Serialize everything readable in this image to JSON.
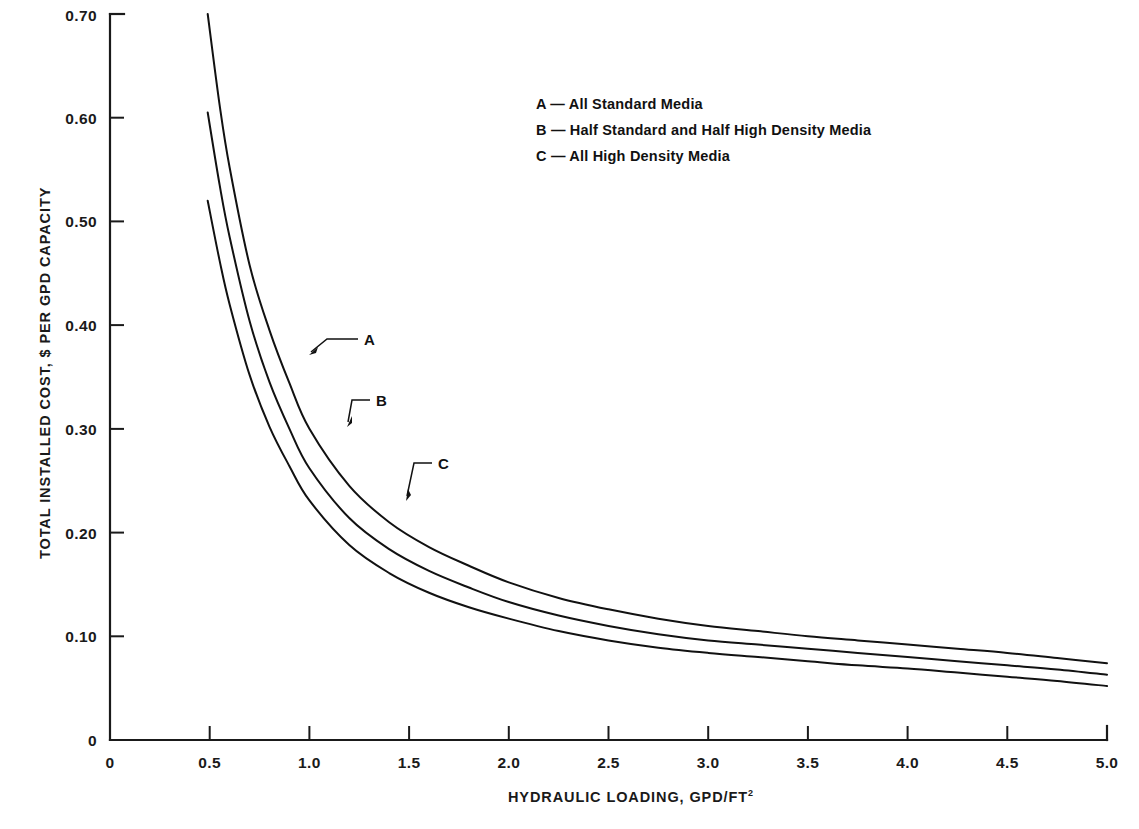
{
  "chart_data": {
    "type": "line",
    "title": "",
    "xlabel": "HYDRAULIC LOADING, GPD/FT",
    "xlabel_superscript": "2",
    "ylabel": "TOTAL INSTALLED COST, $ PER GPD CAPACITY",
    "xlim": [
      0,
      5.0
    ],
    "ylim": [
      0,
      0.7
    ],
    "grid": false,
    "legend_position": "top-center",
    "xticks": [
      "0",
      "0.5",
      "1.0",
      "1.5",
      "2.0",
      "2.5",
      "3.0",
      "3.5",
      "4.0",
      "4.5",
      "5.0"
    ],
    "xtick_values": [
      0,
      0.5,
      1.0,
      1.5,
      2.0,
      2.5,
      3.0,
      3.5,
      4.0,
      4.5,
      5.0
    ],
    "yticks": [
      "0",
      "0.10",
      "0.20",
      "0.30",
      "0.40",
      "0.50",
      "0.60",
      "0.70"
    ],
    "ytick_values": [
      0,
      0.1,
      0.2,
      0.3,
      0.4,
      0.5,
      0.6,
      0.7
    ],
    "x": [
      0.49,
      0.55,
      0.6,
      0.7,
      0.8,
      0.9,
      1.0,
      1.2,
      1.4,
      1.6,
      1.8,
      2.0,
      2.25,
      2.5,
      2.75,
      3.0,
      3.25,
      3.5,
      3.75,
      4.0,
      4.25,
      4.5,
      4.75,
      5.0
    ],
    "series": [
      {
        "name": "A",
        "label": "All Standard Media",
        "legend_text": "A — All Standard Media",
        "annotation": "A",
        "values": [
          0.7,
          0.612,
          0.552,
          0.458,
          0.395,
          0.344,
          0.3,
          0.245,
          0.21,
          0.186,
          0.168,
          0.152,
          0.137,
          0.126,
          0.117,
          0.11,
          0.105,
          0.1,
          0.096,
          0.092,
          0.088,
          0.084,
          0.079,
          0.074
        ]
      },
      {
        "name": "B",
        "label": "Half Standard and Half High Density Media",
        "legend_text": "B — Half Standard and Half High Density Media",
        "annotation": "B",
        "values": [
          0.605,
          0.535,
          0.485,
          0.404,
          0.345,
          0.3,
          0.262,
          0.214,
          0.184,
          0.163,
          0.147,
          0.133,
          0.12,
          0.11,
          0.102,
          0.096,
          0.092,
          0.088,
          0.084,
          0.08,
          0.076,
          0.072,
          0.068,
          0.063
        ]
      },
      {
        "name": "C",
        "label": "All High Density Media",
        "legend_text": "C — All High Density Media",
        "annotation": "C",
        "values": [
          0.52,
          0.462,
          0.42,
          0.352,
          0.302,
          0.264,
          0.231,
          0.188,
          0.161,
          0.142,
          0.128,
          0.117,
          0.105,
          0.096,
          0.089,
          0.084,
          0.08,
          0.076,
          0.072,
          0.069,
          0.065,
          0.061,
          0.057,
          0.052
        ]
      }
    ],
    "legend": [
      "A — All Standard Media",
      "B — Half Standard and Half High Density Media",
      "C — All High Density Media"
    ],
    "annotations": [
      {
        "text": "A",
        "points_to_series": "A",
        "at_x": 1.0,
        "at_y": 0.296
      },
      {
        "text": "B",
        "points_to_series": "B",
        "at_x": 1.2,
        "at_y": 0.214
      },
      {
        "text": "C",
        "points_to_series": "C",
        "at_x": 1.45,
        "at_y": 0.158
      }
    ],
    "colors": {
      "curve": "#111111",
      "axis": "#1a1a1a",
      "background": "#ffffff"
    }
  }
}
